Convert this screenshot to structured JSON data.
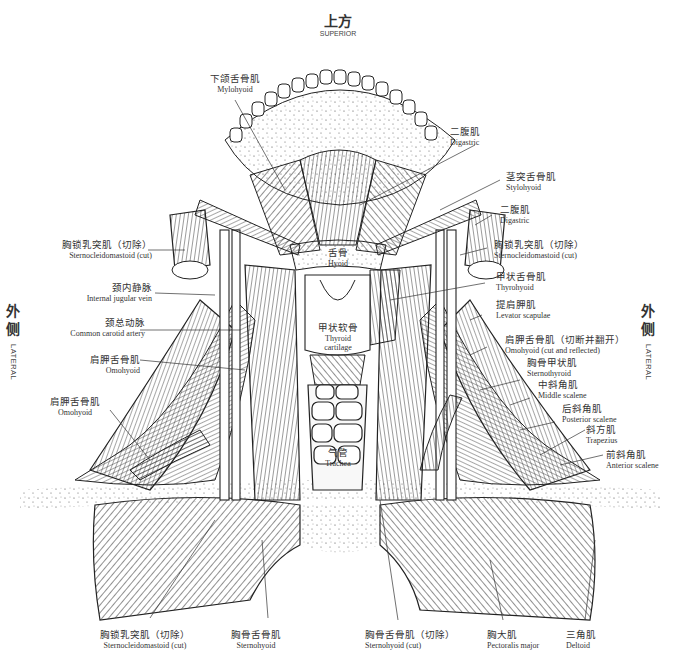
{
  "orientation": {
    "superior": {
      "zh": "上方",
      "en": "SUPERIOR"
    },
    "lateral_left": {
      "zh1": "外",
      "zh2": "侧",
      "en": "LATERAL"
    },
    "lateral_right": {
      "zh1": "外",
      "zh2": "侧",
      "en": "LATERAL"
    }
  },
  "labels": {
    "mylohyoid": {
      "zh": "下颌舌骨肌",
      "en": "Mylohyoid"
    },
    "digastric_top": {
      "zh": "二腹肌",
      "en": "Digastric"
    },
    "stylohyoid": {
      "zh": "茎突舌骨肌",
      "en": "Stylohyoid"
    },
    "digastric_right": {
      "zh": "二腹肌",
      "en": "Digastric"
    },
    "scm_cut_right": {
      "zh": "胸锁乳突肌（切除）",
      "en": "Sternocleidomastoid (cut)"
    },
    "scm_cut_left": {
      "zh": "胸锁乳突肌（切除）",
      "en": "Sternocleidomastoid (cut)"
    },
    "hyoid": {
      "zh": "舌骨",
      "en": "Hyoid"
    },
    "ijv": {
      "zh": "颈内静脉",
      "en": "Internal jugular vein"
    },
    "thyrohyoid": {
      "zh": "甲状舌骨肌",
      "en": "Thyrohyoid"
    },
    "levator": {
      "zh": "提肩胛肌",
      "en": "Levator scapulae"
    },
    "cca": {
      "zh": "颈总动脉",
      "en": "Common carotid artery"
    },
    "thyroid_cart": {
      "zh": "甲状软骨",
      "en1": "Thyroid",
      "en2": "cartilage"
    },
    "omohyoid_cut": {
      "zh": "肩胛舌骨肌（切断并翻开）",
      "en": "Omohyoid (cut and reflected)"
    },
    "omohyoid_left1": {
      "zh": "肩胛舌骨肌",
      "en": "Omohyoid"
    },
    "sternothyroid": {
      "zh": "胸骨甲状肌",
      "en": "Sternothyroid"
    },
    "middle_scalene": {
      "zh": "中斜角肌",
      "en": "Middle scalene"
    },
    "omohyoid_left2": {
      "zh": "肩胛舌骨肌",
      "en": "Omohyoid"
    },
    "posterior_scalene": {
      "zh": "后斜角肌",
      "en": "Posterior scalene"
    },
    "trapezius": {
      "zh": "斜方肌",
      "en": "Trapezius"
    },
    "trachea": {
      "zh": "气管",
      "en": "Trachea"
    },
    "anterior_scalene": {
      "zh": "前斜角肌",
      "en": "Anterior scalene"
    },
    "scm_cut_bottom": {
      "zh": "胸锁乳突肌（切除）",
      "en": "Sternocleidomastoid (cut)"
    },
    "sternohyoid": {
      "zh": "胸骨舌骨肌",
      "en": "Sternohyoid"
    },
    "sternohyoid_cut": {
      "zh": "胸骨舌骨肌（切除）",
      "en": "Sternohyoid (cut)"
    },
    "pectoralis": {
      "zh": "胸大肌",
      "en": "Pectoralis major"
    },
    "deltoid": {
      "zh": "三角肌",
      "en": "Deltoid"
    }
  },
  "colors": {
    "ink": "#1a1a1a",
    "label": "#333333",
    "background": "#ffffff"
  }
}
